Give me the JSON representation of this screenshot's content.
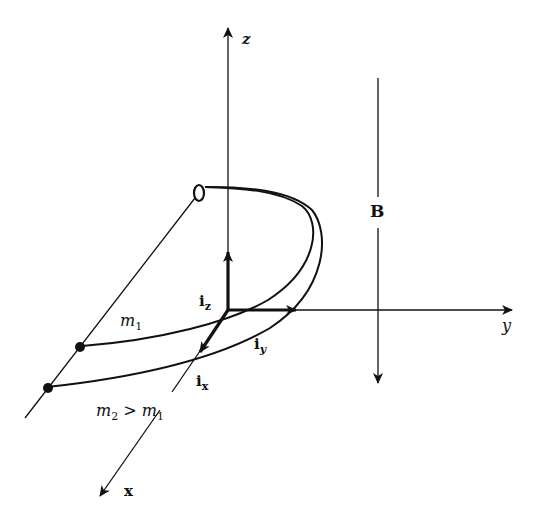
{
  "diagram": {
    "axes": {
      "z": "z",
      "y": "y",
      "x": "x"
    },
    "unit_vectors": {
      "iz": {
        "base": "i",
        "sub": "z"
      },
      "iy": {
        "base": "i",
        "sub": "y"
      },
      "ix": {
        "base": "i",
        "sub": "x"
      }
    },
    "field": {
      "label": "B"
    },
    "masses": {
      "m1": {
        "base": "m",
        "sub": "1"
      },
      "m2_relation": {
        "base": "m",
        "sub": "2",
        "op": " > ",
        "base2": "m",
        "sub2": "1"
      }
    },
    "colors": {
      "ink": "#111111",
      "background": "#ffffff"
    }
  }
}
